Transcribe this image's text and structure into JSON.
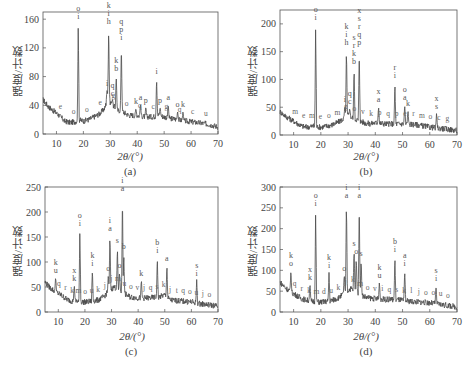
{
  "chart_data": [
    {
      "panel": "(a)",
      "type": "line",
      "title": "",
      "xlabel": "2θ/(°)",
      "ylabel": "强度/计数",
      "xlim": [
        5,
        70
      ],
      "ylim": [
        0,
        170
      ],
      "xticks": [
        10,
        20,
        30,
        40,
        50,
        60,
        70
      ],
      "yticks": [
        0,
        40,
        80,
        120,
        160
      ],
      "grid": false,
      "baseline": [
        [
          5,
          48
        ],
        [
          7,
          38
        ],
        [
          9,
          32
        ],
        [
          11,
          26
        ],
        [
          13,
          18
        ],
        [
          15,
          16
        ],
        [
          17,
          17
        ],
        [
          18,
          20
        ],
        [
          20,
          18
        ],
        [
          22,
          20
        ],
        [
          24,
          24
        ],
        [
          26,
          28
        ],
        [
          28,
          36
        ],
        [
          29,
          52
        ],
        [
          30,
          44
        ],
        [
          31,
          40
        ],
        [
          32,
          36
        ],
        [
          33,
          32
        ],
        [
          34,
          34
        ],
        [
          35,
          30
        ],
        [
          37,
          26
        ],
        [
          40,
          26
        ],
        [
          43,
          24
        ],
        [
          46,
          24
        ],
        [
          48,
          26
        ],
        [
          50,
          24
        ],
        [
          52,
          22
        ],
        [
          55,
          20
        ],
        [
          58,
          18
        ],
        [
          62,
          16
        ],
        [
          66,
          14
        ],
        [
          70,
          10
        ]
      ],
      "peaks": [
        {
          "x": 18.1,
          "y": 155,
          "labels": "o i"
        },
        {
          "x": 29.4,
          "y": 148,
          "labels": "k i h"
        },
        {
          "x": 32.2,
          "y": 82,
          "labels": "k b"
        },
        {
          "x": 34.1,
          "y": 125,
          "labels": "q p i"
        },
        {
          "x": 47.2,
          "y": 78,
          "labels": "i"
        },
        {
          "x": 28.8,
          "y": 62,
          "labels": "i"
        },
        {
          "x": 30.8,
          "y": 48,
          "labels": "q c"
        },
        {
          "x": 39.5,
          "y": 36,
          "labels": "k"
        },
        {
          "x": 41.2,
          "y": 42,
          "labels": "a"
        },
        {
          "x": 43.2,
          "y": 38,
          "labels": "p"
        },
        {
          "x": 48.5,
          "y": 38,
          "labels": "p"
        },
        {
          "x": 51.5,
          "y": 42,
          "labels": "a"
        },
        {
          "x": 55,
          "y": 32,
          "labels": "o"
        },
        {
          "x": 57,
          "y": 32,
          "labels": "k"
        }
      ],
      "minor_labels": [
        "e",
        "o",
        "o",
        "e",
        "g",
        "o",
        "q",
        "c",
        "g",
        "q",
        "c",
        "u"
      ]
    },
    {
      "panel": "(b)",
      "type": "line",
      "title": "",
      "xlabel": "2θ/(°)",
      "ylabel": "强度/计数",
      "xlim": [
        5,
        70
      ],
      "ylim": [
        0,
        225
      ],
      "xticks": [
        10,
        20,
        30,
        40,
        50,
        60,
        70
      ],
      "yticks": [
        0,
        50,
        100,
        150,
        200
      ],
      "grid": false,
      "baseline": [
        [
          5,
          42
        ],
        [
          7,
          34
        ],
        [
          9,
          28
        ],
        [
          11,
          22
        ],
        [
          13,
          16
        ],
        [
          15,
          14
        ],
        [
          17,
          16
        ],
        [
          20,
          14
        ],
        [
          22,
          16
        ],
        [
          24,
          18
        ],
        [
          26,
          22
        ],
        [
          28,
          28
        ],
        [
          30,
          36
        ],
        [
          32,
          30
        ],
        [
          34,
          26
        ],
        [
          36,
          22
        ],
        [
          38,
          20
        ],
        [
          40,
          22
        ],
        [
          44,
          20
        ],
        [
          48,
          20
        ],
        [
          52,
          20
        ],
        [
          56,
          18
        ],
        [
          60,
          14
        ],
        [
          64,
          12
        ],
        [
          70,
          8
        ]
      ],
      "peaks": [
        {
          "x": 18.1,
          "y": 200,
          "labels": "o i"
        },
        {
          "x": 29.4,
          "y": 155,
          "labels": "k i h"
        },
        {
          "x": 32.2,
          "y": 120,
          "labels": "s r k b"
        },
        {
          "x": 34.1,
          "y": 155,
          "labels": "x s r q p"
        },
        {
          "x": 47.2,
          "y": 95,
          "labels": "r i"
        },
        {
          "x": 28.8,
          "y": 52,
          "labels": "i"
        },
        {
          "x": 30.6,
          "y": 48,
          "labels": "q c"
        },
        {
          "x": 41.2,
          "y": 52,
          "labels": "x a"
        },
        {
          "x": 50.8,
          "y": 55,
          "labels": "o a"
        },
        {
          "x": 52,
          "y": 45,
          "labels": "k"
        },
        {
          "x": 62.5,
          "y": 40,
          "labels": "x s"
        }
      ],
      "minor_labels": [
        "m",
        "e",
        "m",
        "e",
        "o",
        "m",
        "g",
        "o",
        "v",
        "k",
        "p",
        "q",
        "p",
        "e",
        "r",
        "m",
        "o",
        "c",
        "g"
      ]
    },
    {
      "panel": "(c)",
      "type": "line",
      "title": "",
      "xlabel": "2θ/(°)",
      "ylabel": "强度/计数",
      "xlim": [
        5,
        70
      ],
      "ylim": [
        0,
        250
      ],
      "xticks": [
        10,
        20,
        30,
        40,
        50,
        60,
        70
      ],
      "yticks": [
        0,
        50,
        100,
        150,
        200,
        250
      ],
      "grid": false,
      "baseline": [
        [
          5,
          60
        ],
        [
          7,
          48
        ],
        [
          9,
          40
        ],
        [
          11,
          34
        ],
        [
          13,
          26
        ],
        [
          15,
          22
        ],
        [
          17,
          22
        ],
        [
          19,
          20
        ],
        [
          21,
          20
        ],
        [
          23,
          22
        ],
        [
          25,
          24
        ],
        [
          27,
          30
        ],
        [
          29,
          42
        ],
        [
          31,
          50
        ],
        [
          33,
          44
        ],
        [
          35,
          36
        ],
        [
          37,
          30
        ],
        [
          40,
          28
        ],
        [
          44,
          28
        ],
        [
          48,
          30
        ],
        [
          50,
          34
        ],
        [
          52,
          24
        ],
        [
          56,
          22
        ],
        [
          60,
          20
        ],
        [
          64,
          16
        ],
        [
          70,
          12
        ]
      ],
      "peaks": [
        {
          "x": 18.1,
          "y": 165,
          "labels": "o i"
        },
        {
          "x": 29.4,
          "y": 155,
          "labels": "i a"
        },
        {
          "x": 32.2,
          "y": 130,
          "labels": "s"
        },
        {
          "x": 34.1,
          "y": 235,
          "labels": "i a"
        },
        {
          "x": 34.6,
          "y": 118,
          "labels": "b"
        },
        {
          "x": 47.2,
          "y": 110,
          "labels": "b i"
        },
        {
          "x": 50.8,
          "y": 95,
          "labels": "a"
        },
        {
          "x": 62,
          "y": 65,
          "labels": "s i"
        },
        {
          "x": 9,
          "y": 70,
          "labels": "k u"
        },
        {
          "x": 16,
          "y": 55,
          "labels": "x k"
        },
        {
          "x": 22.8,
          "y": 85,
          "labels": "k i"
        },
        {
          "x": 41.2,
          "y": 65,
          "labels": "k"
        },
        {
          "x": 28.8,
          "y": 75,
          "labels": "o"
        },
        {
          "x": 33,
          "y": 80,
          "labels": "o"
        }
      ],
      "minor_labels": [
        "q",
        "r",
        "k",
        "m",
        "o",
        "u",
        "k",
        "j",
        "j",
        "m",
        "u",
        "o",
        "v",
        "j",
        "q",
        "s",
        "k",
        "j",
        "t",
        "q",
        "o",
        "u",
        "j",
        "o"
      ]
    },
    {
      "panel": "(d)",
      "type": "line",
      "title": "",
      "xlabel": "2θ/(°)",
      "ylabel": "强度/计数",
      "xlim": [
        5,
        70
      ],
      "ylim": [
        0,
        300
      ],
      "xticks": [
        10,
        20,
        30,
        40,
        50,
        60,
        70
      ],
      "yticks": [
        0,
        50,
        100,
        150,
        200,
        250,
        300
      ],
      "grid": false,
      "baseline": [
        [
          5,
          72
        ],
        [
          7,
          58
        ],
        [
          9,
          48
        ],
        [
          11,
          40
        ],
        [
          13,
          32
        ],
        [
          15,
          28
        ],
        [
          17,
          26
        ],
        [
          19,
          24
        ],
        [
          21,
          24
        ],
        [
          23,
          26
        ],
        [
          25,
          30
        ],
        [
          27,
          36
        ],
        [
          29,
          48
        ],
        [
          31,
          56
        ],
        [
          33,
          50
        ],
        [
          35,
          40
        ],
        [
          37,
          34
        ],
        [
          40,
          32
        ],
        [
          44,
          30
        ],
        [
          48,
          30
        ],
        [
          52,
          26
        ],
        [
          56,
          24
        ],
        [
          60,
          22
        ],
        [
          64,
          18
        ],
        [
          70,
          12
        ]
      ],
      "peaks": [
        {
          "x": 18.1,
          "y": 245,
          "labels": "o i"
        },
        {
          "x": 29.4,
          "y": 265,
          "labels": "i a"
        },
        {
          "x": 34.1,
          "y": 265,
          "labels": "i a"
        },
        {
          "x": 32.2,
          "y": 150,
          "labels": "s"
        },
        {
          "x": 33,
          "y": 130,
          "labels": "o"
        },
        {
          "x": 34.8,
          "y": 125,
          "labels": "s"
        },
        {
          "x": 47.2,
          "y": 135,
          "labels": "b i"
        },
        {
          "x": 50.8,
          "y": 100,
          "labels": "a i"
        },
        {
          "x": 62.3,
          "y": 65,
          "labels": "s i"
        },
        {
          "x": 9,
          "y": 100,
          "labels": "k o"
        },
        {
          "x": 16,
          "y": 68,
          "labels": "x k"
        },
        {
          "x": 23,
          "y": 95,
          "labels": "k i"
        },
        {
          "x": 28.6,
          "y": 90,
          "labels": "o"
        },
        {
          "x": 41.5,
          "y": 72,
          "labels": "k u"
        }
      ],
      "minor_labels": [
        "q",
        "r",
        "k",
        "m",
        "d",
        "u",
        "k",
        "j",
        "k",
        "m",
        "o",
        "v",
        "i",
        "q",
        "s",
        "k",
        "l",
        "j",
        "o",
        "o",
        "u",
        "o"
      ]
    }
  ],
  "panels": [
    {
      "caption": "(a)",
      "xlabel": "2θ/(°)",
      "ylabel": "强度/计数"
    },
    {
      "caption": "(b)",
      "xlabel": "2θ/(°)",
      "ylabel": "强度/计数"
    },
    {
      "caption": "(c)",
      "xlabel": "2θ/(°)",
      "ylabel": "强度/计数"
    },
    {
      "caption": "(d)",
      "xlabel": "2θ/(°)",
      "ylabel": "强度/计数"
    }
  ],
  "colors": {
    "trace": "#4a4a4a",
    "axis": "#555555",
    "text": "#444444"
  }
}
